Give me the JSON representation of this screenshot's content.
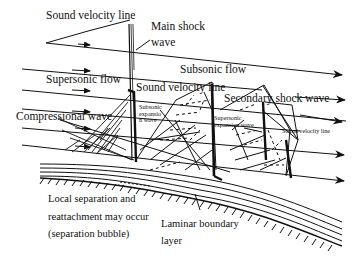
{
  "diagram": {
    "labels": {
      "sound_velocity_line_top": "Sound velocity line",
      "main_shock_1": "Main shock",
      "main_shock_2": "wave",
      "subsonic_flow": "Subsonic flow",
      "supersonic_flow": "Supersonic flow",
      "sound_velocity_line_mid": "Sound velocity line",
      "secondary_shock_wave": "Secondary shock wave",
      "compressional_wave": "Compressional wave",
      "subsonic_expansion_1": "Subsonic",
      "subsonic_expansion_2": "expansio",
      "subsonic_expansion_3": "n wave",
      "supersonic_expansion_1": "Supersonic",
      "supersonic_expansion_2": "expansion wave",
      "sound_velocity_line_right": "Sound velocity line",
      "local_separation_1": "Local separation and",
      "local_separation_2": "reattachment may occur",
      "local_separation_3": "(separation bubble)",
      "laminar_1": "Laminar boundary",
      "laminar_2": "layer"
    },
    "colors": {
      "ink": "#111111",
      "background": "#ffffff"
    }
  }
}
